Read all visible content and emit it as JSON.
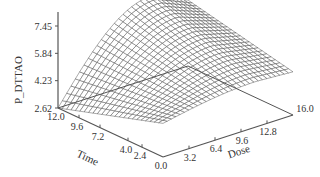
{
  "chart_data": {
    "type": "surface3d",
    "title": "",
    "xlabel": "Time",
    "ylabel": "Dose",
    "zlabel": "P_DTTAO",
    "x_ticks": [
      "12.0",
      "9.6",
      "7.2",
      "4.0",
      "2.4",
      "0.0"
    ],
    "y_ticks": [
      "3.2",
      "6.4",
      "9.6",
      "12.8",
      "16.0"
    ],
    "z_ticks": [
      "2.62",
      "4.23",
      "5.84",
      "7.45"
    ],
    "xlim": [
      0.0,
      12.0
    ],
    "ylim": [
      0.0,
      16.0
    ],
    "zlim": [
      2.62,
      7.45
    ],
    "grid": false,
    "legend": null,
    "surface_samples": {
      "time": [
        0.0,
        4.0,
        8.0,
        12.0
      ],
      "dose": [
        0.0,
        4.0,
        8.0,
        12.0,
        16.0
      ],
      "values": [
        [
          4.6,
          4.9,
          5.2,
          5.3,
          5.1
        ],
        [
          4.2,
          5.0,
          5.9,
          6.3,
          6.0
        ],
        [
          3.6,
          5.0,
          6.5,
          7.1,
          6.7
        ],
        [
          2.62,
          4.8,
          6.8,
          7.45,
          7.0
        ]
      ]
    }
  },
  "axes": {
    "z_label": "P_DTTAO",
    "time_label": "Time",
    "dose_label": "Dose"
  },
  "colors": {
    "mesh": "#444444",
    "axis": "#555555",
    "text": "#333333",
    "background": "#ffffff"
  }
}
